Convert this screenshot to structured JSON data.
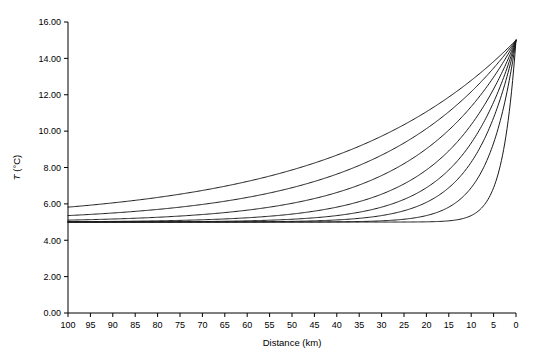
{
  "chart_data": {
    "type": "line",
    "title": "",
    "xlabel": "Distance (km)",
    "ylabel": "T (°C)",
    "ylabel_symbol": "T",
    "ylabel_units": " (°C)",
    "xlim": [
      100,
      0
    ],
    "ylim": [
      0.0,
      16.0
    ],
    "x_reversed": true,
    "grid": false,
    "legend": null,
    "legend_position": "none",
    "x_ticks": [
      100,
      95,
      90,
      85,
      80,
      75,
      70,
      65,
      60,
      55,
      50,
      45,
      40,
      35,
      30,
      25,
      20,
      15,
      10,
      5,
      0
    ],
    "x_tick_labels": [
      "100",
      "95",
      "90",
      "85",
      "80",
      "75",
      "70",
      "65",
      "60",
      "55",
      "50",
      "45",
      "40",
      "35",
      "30",
      "25",
      "20",
      "15",
      "10",
      "5",
      "0"
    ],
    "y_ticks": [
      0.0,
      2.0,
      4.0,
      6.0,
      8.0,
      10.0,
      12.0,
      14.0,
      16.0
    ],
    "y_tick_labels": [
      "0.00",
      "2.00",
      "4.00",
      "6.00",
      "8.00",
      "10.00",
      "12.00",
      "14.00",
      "16.00"
    ],
    "line_color": "#1a1a1a",
    "baseline_T": 5.0,
    "boundary_T": 15.0,
    "n_series": 8,
    "x": [
      100,
      95,
      90,
      85,
      80,
      75,
      70,
      65,
      60,
      55,
      50,
      45,
      40,
      35,
      30,
      25,
      20,
      15,
      10,
      5,
      0
    ],
    "series": [
      {
        "name": "decay-length-40km",
        "decay_km": 40,
        "values": [
          5.82,
          5.89,
          5.97,
          6.06,
          6.16,
          6.27,
          6.39,
          6.52,
          6.67,
          6.84,
          7.02,
          7.22,
          7.45,
          7.7,
          7.98,
          8.29,
          8.64,
          9.02,
          9.45,
          9.92,
          15.0
        ]
      },
      {
        "name": "decay-length-30km",
        "decay_km": 30,
        "values": [
          5.36,
          5.42,
          5.5,
          5.59,
          5.68,
          5.8,
          5.92,
          6.06,
          6.22,
          6.41,
          6.61,
          6.85,
          7.11,
          7.42,
          7.76,
          8.16,
          8.61,
          9.13,
          9.73,
          10.42,
          15.0
        ]
      },
      {
        "name": "decay-length-22km",
        "decay_km": 22,
        "values": [
          5.11,
          5.14,
          5.18,
          5.22,
          5.28,
          5.35,
          5.43,
          5.53,
          5.65,
          5.79,
          5.96,
          6.17,
          6.41,
          6.71,
          7.06,
          7.48,
          7.99,
          8.6,
          9.33,
          10.22,
          15.0
        ]
      },
      {
        "name": "decay-length-16km",
        "decay_km": 16,
        "values": [
          5.02,
          5.03,
          5.04,
          5.06,
          5.08,
          5.11,
          5.15,
          5.2,
          5.27,
          5.36,
          5.48,
          5.63,
          5.83,
          6.09,
          6.43,
          6.87,
          7.44,
          8.18,
          9.15,
          10.41,
          15.0
        ]
      },
      {
        "name": "decay-length-12km",
        "decay_km": 12,
        "values": [
          5.0,
          5.0,
          5.01,
          5.01,
          5.02,
          5.03,
          5.04,
          5.06,
          5.09,
          5.14,
          5.21,
          5.31,
          5.45,
          5.65,
          5.93,
          6.32,
          6.87,
          7.63,
          8.69,
          10.17,
          15.0
        ]
      },
      {
        "name": "decay-length-9km",
        "decay_km": 9,
        "values": [
          5.0,
          5.0,
          5.0,
          5.0,
          5.0,
          5.01,
          5.01,
          5.02,
          5.03,
          5.05,
          5.08,
          5.13,
          5.21,
          5.33,
          5.52,
          5.8,
          6.23,
          6.86,
          7.8,
          9.19,
          15.0
        ]
      },
      {
        "name": "decay-length-6km",
        "decay_km": 6,
        "values": [
          5.0,
          5.0,
          5.0,
          5.0,
          5.0,
          5.0,
          5.0,
          5.0,
          5.0,
          5.01,
          5.01,
          5.02,
          5.04,
          5.07,
          5.13,
          5.24,
          5.43,
          5.76,
          6.34,
          7.35,
          15.0
        ]
      },
      {
        "name": "decay-length-3km",
        "decay_km": 3,
        "values": [
          5.0,
          5.0,
          5.0,
          5.0,
          5.0,
          5.0,
          5.0,
          5.0,
          5.0,
          5.0,
          5.0,
          5.0,
          5.0,
          5.0,
          5.0,
          5.01,
          5.02,
          5.06,
          5.18,
          5.64,
          15.0
        ]
      }
    ]
  }
}
